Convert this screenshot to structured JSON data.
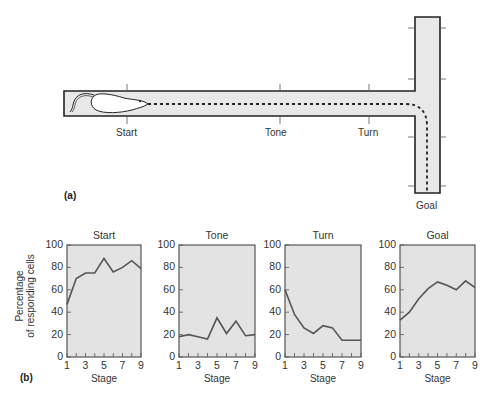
{
  "figure": {
    "panel_a": {
      "label": "(a)",
      "maze_labels": {
        "start": "Start",
        "tone": "Tone",
        "turn": "Turn",
        "goal": "Goal"
      }
    },
    "panel_b": {
      "label": "(b)",
      "ylabel_line1": "Percentage",
      "ylabel_line2": "of responding cells",
      "xlabel": "Stage"
    }
  },
  "colors": {
    "maze_fill": "#e8e8e8",
    "maze_stroke": "#222222",
    "plot_bg": "#e3e3e3",
    "plot_line": "#555555",
    "axis": "#555555"
  },
  "chart_data": [
    {
      "type": "line",
      "title": "Start",
      "xlabel": "Stage",
      "ylabel": "Percentage of responding cells",
      "x": [
        1,
        2,
        3,
        4,
        5,
        6,
        7,
        8,
        9
      ],
      "values": [
        47,
        70,
        75,
        75,
        88,
        76,
        80,
        86,
        79
      ],
      "xticks": [
        "1",
        "3",
        "5",
        "7",
        "9"
      ],
      "yticks": [
        "0",
        "20",
        "40",
        "60",
        "80",
        "100"
      ],
      "ylim": [
        0,
        100
      ],
      "xlim": [
        1,
        9
      ],
      "grid": false
    },
    {
      "type": "line",
      "title": "Tone",
      "xlabel": "Stage",
      "ylabel": "",
      "x": [
        1,
        2,
        3,
        4,
        5,
        6,
        7,
        8,
        9
      ],
      "values": [
        18,
        20,
        18,
        16,
        35,
        21,
        32,
        19,
        20
      ],
      "xticks": [
        "1",
        "3",
        "5",
        "7",
        "9"
      ],
      "yticks": [
        "0",
        "20",
        "40",
        "60",
        "80",
        "100"
      ],
      "ylim": [
        0,
        100
      ],
      "xlim": [
        1,
        9
      ],
      "grid": false
    },
    {
      "type": "line",
      "title": "Turn",
      "xlabel": "Stage",
      "ylabel": "",
      "x": [
        1,
        2,
        3,
        4,
        5,
        6,
        7,
        8,
        9
      ],
      "values": [
        60,
        38,
        26,
        21,
        28,
        26,
        15,
        15,
        15
      ],
      "xticks": [
        "1",
        "3",
        "5",
        "7",
        "9"
      ],
      "yticks": [
        "0",
        "20",
        "40",
        "60",
        "80",
        "100"
      ],
      "ylim": [
        0,
        100
      ],
      "xlim": [
        1,
        9
      ],
      "grid": false
    },
    {
      "type": "line",
      "title": "Goal",
      "xlabel": "Stage",
      "ylabel": "",
      "x": [
        1,
        2,
        3,
        4,
        5,
        6,
        7,
        8,
        9
      ],
      "values": [
        33,
        40,
        52,
        61,
        67,
        64,
        60,
        68,
        62
      ],
      "xticks": [
        "1",
        "3",
        "5",
        "7",
        "9"
      ],
      "yticks": [
        "0",
        "20",
        "40",
        "60",
        "80",
        "100"
      ],
      "ylim": [
        0,
        100
      ],
      "xlim": [
        1,
        9
      ],
      "grid": false
    }
  ]
}
